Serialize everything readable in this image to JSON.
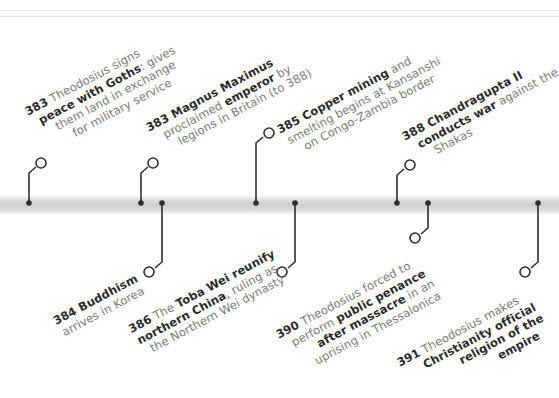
{
  "timeline": {
    "axis_color": "#cfcfcf",
    "connector_color": "#2e2e2e",
    "events_above": [
      {
        "year": "383",
        "lines": [
          [
            "383",
            " Theodosius signs"
          ],
          [
            "peace with Goths",
            ": gives"
          ],
          [
            "",
            "them land in exchange"
          ],
          [
            "",
            "for military service"
          ]
        ]
      },
      {
        "year": "383",
        "lines": [
          [
            "383 Magnus Maximus",
            ""
          ],
          [
            "",
            "proclaimed "
          ],
          [
            "",
            "legions in Britain (to 388)"
          ]
        ],
        "bold_inline": "emperor",
        "after_bold": " by"
      },
      {
        "year": "385",
        "lines": [
          [
            "385 Copper mining",
            " and"
          ],
          [
            "",
            "smelting begins at Kansanshi"
          ],
          [
            "",
            "on Congo-Zambia border"
          ]
        ]
      },
      {
        "year": "388",
        "lines": [
          [
            "388 Chandragupta II",
            ""
          ],
          [
            "conducts war",
            " against the"
          ],
          [
            "",
            "Shakas"
          ]
        ]
      }
    ],
    "events_below": [
      {
        "year": "384",
        "lines": [
          [
            "384 Buddhism",
            ""
          ],
          [
            "",
            "arrives in Korea"
          ]
        ]
      },
      {
        "year": "386",
        "lines": [
          [
            "386",
            " The "
          ],
          [
            "northern China",
            ", ruling as"
          ],
          [
            "",
            "the Northern Wei dynasty"
          ]
        ],
        "bold_inline": "Toba Wei reunify"
      },
      {
        "year": "390",
        "lines": [
          [
            "390",
            " Theodosius forced to"
          ],
          [
            "",
            "perform "
          ],
          [
            "after massacre",
            " in an"
          ],
          [
            "",
            "uprising in Thessalonica"
          ]
        ],
        "bold_inline": "public penance"
      },
      {
        "year": "391",
        "lines": [
          [
            "391",
            " Theodosius makes"
          ],
          [
            "Christianity official",
            ""
          ],
          [
            "religion of the",
            ""
          ],
          [
            "empire",
            ""
          ]
        ]
      }
    ]
  },
  "text": {
    "e383a_year": "383",
    "e383a_l1": " Theodosius signs",
    "e383a_b2": "peace with Goths",
    "e383a_l2": ": gives",
    "e383a_l3": "them land in exchange",
    "e383a_l4": "for military service",
    "e383b_b1": "383 Magnus Maximus",
    "e383b_l2a": "proclaimed ",
    "e383b_b2": "emperor",
    "e383b_l2b": " by",
    "e383b_l3": "legions in Britain (to 388)",
    "e385_b1": "385 Copper mining",
    "e385_l1": " and",
    "e385_l2": "smelting begins at Kansanshi",
    "e385_l3": "on Congo-Zambia border",
    "e388_b1": "388 Chandragupta II",
    "e388_b2": "conducts war",
    "e388_l2": " against the",
    "e388_l3": "Shakas",
    "e384_b1": "384 Buddhism",
    "e384_l2": "arrives in Korea",
    "e386_year": "386",
    "e386_l1": " The ",
    "e386_b1": "Toba Wei reunify",
    "e386_b2": "northern China",
    "e386_l2": ", ruling as",
    "e386_l3": "the Northern Wei dynasty",
    "e390_year": "390",
    "e390_l1": " Theodosius forced to",
    "e390_l2": "perform ",
    "e390_b2": "public penance",
    "e390_b3": "after massacre",
    "e390_l3": " in an",
    "e390_l4": "uprising in Thessalonica",
    "e391_year": "391",
    "e391_l1": " Theodosius makes",
    "e391_b2": "Christianity official",
    "e391_b3": "religion of the",
    "e391_b4": "empire"
  }
}
